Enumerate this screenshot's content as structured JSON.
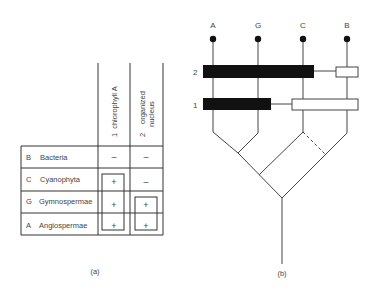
{
  "table": {
    "columns": [
      {
        "number": "1",
        "label": "chlorophyll A"
      },
      {
        "number": "2",
        "label_line1": "organized",
        "label_line2": "nucleus"
      }
    ],
    "rows": [
      {
        "code": "B",
        "name": "Bacteria",
        "col1": "–",
        "col2": "–"
      },
      {
        "code": "C",
        "name": "Cyanophyta",
        "col1": "+",
        "col2": "–"
      },
      {
        "code": "G",
        "name": "Gymnospermae",
        "col1": "+",
        "col2": "+"
      },
      {
        "code": "A",
        "name": "Angiospermae",
        "col1": "+",
        "col2": "+"
      }
    ],
    "caption": "(a)"
  },
  "tree": {
    "taxa": [
      "A",
      "G",
      "C",
      "B"
    ],
    "character_labels": [
      "2",
      "1"
    ],
    "caption": "(b)"
  }
}
